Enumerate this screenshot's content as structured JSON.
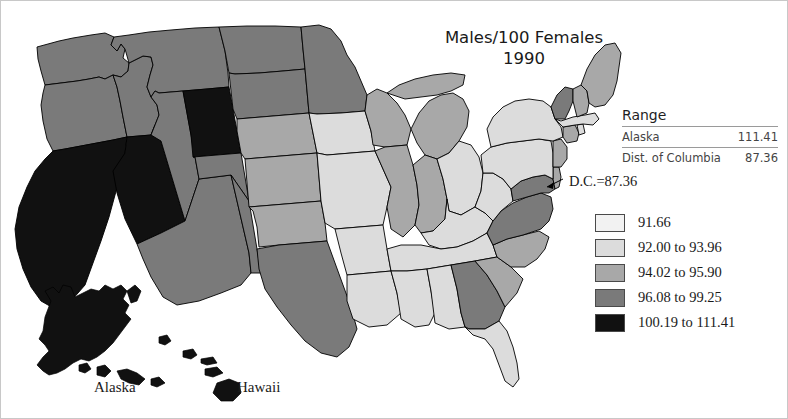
{
  "title": {
    "line1": "Males/100 Females",
    "line2": "1990"
  },
  "range_table": {
    "header": "Range",
    "rows": [
      {
        "label": "Alaska",
        "value": "111.41"
      },
      {
        "label": "Dist. of Columbia",
        "value": "87.36"
      }
    ]
  },
  "annotations": {
    "dc_callout": "D.C.=87.36",
    "alaska_label": "Alaska",
    "hawaii_label": "Hawaii"
  },
  "legend": {
    "items": [
      {
        "label": "91.66",
        "color": "#f2f2f2"
      },
      {
        "label": "92.00 to 93.96",
        "color": "#dcdcdc"
      },
      {
        "label": "94.02 to 95.90",
        "color": "#a8a8a8"
      },
      {
        "label": "96.08 to 99.25",
        "color": "#7a7a7a"
      },
      {
        "label": "100.19 to 111.41",
        "color": "#111111"
      }
    ]
  },
  "chart_data": {
    "type": "choropleth",
    "title": "Males/100 Females 1990",
    "variable": "Males per 100 Females",
    "year": "1990",
    "units": "males per 100 females",
    "class_colors": [
      "#f2f2f2",
      "#dcdcdc",
      "#a8a8a8",
      "#7a7a7a",
      "#111111"
    ],
    "class_labels": [
      "91.66",
      "92.00 to 93.96",
      "94.02 to 95.90",
      "96.08 to 99.25",
      "100.19 to 111.41"
    ],
    "range_min": {
      "name": "Dist. of Columbia",
      "value": 87.36
    },
    "range_max": {
      "name": "Alaska",
      "value": 111.41
    },
    "regions": [
      {
        "id": "AK",
        "name": "Alaska",
        "class": 4
      },
      {
        "id": "HI",
        "name": "Hawaii",
        "class": 4
      },
      {
        "id": "WA",
        "name": "Washington",
        "class": 3
      },
      {
        "id": "OR",
        "name": "Oregon",
        "class": 3
      },
      {
        "id": "CA",
        "name": "California",
        "class": 4
      },
      {
        "id": "NV",
        "name": "Nevada",
        "class": 4
      },
      {
        "id": "ID",
        "name": "Idaho",
        "class": 3
      },
      {
        "id": "MT",
        "name": "Montana",
        "class": 3
      },
      {
        "id": "WY",
        "name": "Wyoming",
        "class": 4
      },
      {
        "id": "UT",
        "name": "Utah",
        "class": 3
      },
      {
        "id": "AZ",
        "name": "Arizona",
        "class": 3
      },
      {
        "id": "CO",
        "name": "Colorado",
        "class": 3
      },
      {
        "id": "NM",
        "name": "New Mexico",
        "class": 3
      },
      {
        "id": "ND",
        "name": "North Dakota",
        "class": 3
      },
      {
        "id": "SD",
        "name": "South Dakota",
        "class": 3
      },
      {
        "id": "NE",
        "name": "Nebraska",
        "class": 2
      },
      {
        "id": "KS",
        "name": "Kansas",
        "class": 2
      },
      {
        "id": "OK",
        "name": "Oklahoma",
        "class": 2
      },
      {
        "id": "TX",
        "name": "Texas",
        "class": 3
      },
      {
        "id": "MN",
        "name": "Minnesota",
        "class": 3
      },
      {
        "id": "IA",
        "name": "Iowa",
        "class": 1
      },
      {
        "id": "MO",
        "name": "Missouri",
        "class": 1
      },
      {
        "id": "AR",
        "name": "Arkansas",
        "class": 1
      },
      {
        "id": "LA",
        "name": "Louisiana",
        "class": 1
      },
      {
        "id": "WI",
        "name": "Wisconsin",
        "class": 2
      },
      {
        "id": "IL",
        "name": "Illinois",
        "class": 2
      },
      {
        "id": "MI",
        "name": "Michigan",
        "class": 2
      },
      {
        "id": "IN",
        "name": "Indiana",
        "class": 2
      },
      {
        "id": "OH",
        "name": "Ohio",
        "class": 1
      },
      {
        "id": "KY",
        "name": "Kentucky",
        "class": 1
      },
      {
        "id": "TN",
        "name": "Tennessee",
        "class": 1
      },
      {
        "id": "MS",
        "name": "Mississippi",
        "class": 1
      },
      {
        "id": "AL",
        "name": "Alabama",
        "class": 1
      },
      {
        "id": "GA",
        "name": "Georgia",
        "class": 3
      },
      {
        "id": "FL",
        "name": "Florida",
        "class": 1
      },
      {
        "id": "SC",
        "name": "South Carolina",
        "class": 2
      },
      {
        "id": "NC",
        "name": "North Carolina",
        "class": 2
      },
      {
        "id": "VA",
        "name": "Virginia",
        "class": 3
      },
      {
        "id": "WV",
        "name": "West Virginia",
        "class": 1
      },
      {
        "id": "MD",
        "name": "Maryland",
        "class": 3
      },
      {
        "id": "DE",
        "name": "Delaware",
        "class": 2
      },
      {
        "id": "DC",
        "name": "District of Columbia",
        "class": 0
      },
      {
        "id": "PA",
        "name": "Pennsylvania",
        "class": 1
      },
      {
        "id": "NY",
        "name": "New York",
        "class": 1
      },
      {
        "id": "NJ",
        "name": "New Jersey",
        "class": 2
      },
      {
        "id": "CT",
        "name": "Connecticut",
        "class": 2
      },
      {
        "id": "RI",
        "name": "Rhode Island",
        "class": 1
      },
      {
        "id": "MA",
        "name": "Massachusetts",
        "class": 1
      },
      {
        "id": "VT",
        "name": "Vermont",
        "class": 3
      },
      {
        "id": "NH",
        "name": "New Hampshire",
        "class": 2
      },
      {
        "id": "ME",
        "name": "Maine",
        "class": 2
      }
    ]
  }
}
